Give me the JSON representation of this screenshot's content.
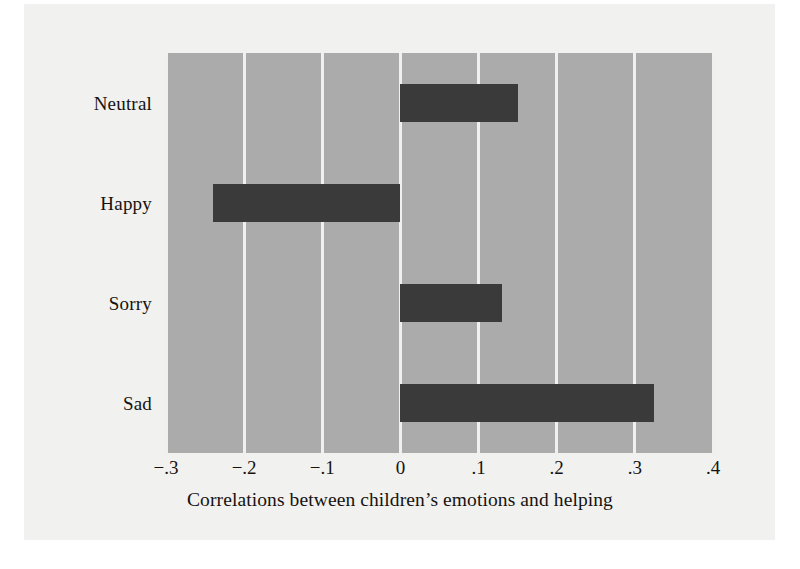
{
  "figure": {
    "background_color": "#f1f1f0",
    "page_color": "#ffffff"
  },
  "chart_data": {
    "type": "bar",
    "orientation": "horizontal",
    "title": "",
    "subtitle": "",
    "xlabel": "Correlations between children’s emotions and helping",
    "ylabel": "",
    "categories": [
      "Neutral",
      "Happy",
      "Sorry",
      "Sad"
    ],
    "values": [
      0.15,
      -0.24,
      0.13,
      0.325
    ],
    "series": [
      {
        "name": "Correlation",
        "values": [
          0.15,
          -0.24,
          0.13,
          0.325
        ]
      }
    ],
    "xlim": [
      -0.3,
      0.4
    ],
    "xticks": [
      -0.3,
      -0.2,
      -0.1,
      0,
      0.1,
      0.2,
      0.3,
      0.4
    ],
    "xticklabels": [
      "−.3",
      "−.2",
      "−.1",
      "0",
      ".1",
      ".2",
      ".3",
      ".4"
    ],
    "grid": true,
    "grid_axis": "x",
    "grid_color": "#f0f0ef",
    "legend": false,
    "legend_position": "none",
    "plot_background_color": "#ababab",
    "bar_color": "#3a3a3a",
    "text_color": "#16130f"
  }
}
